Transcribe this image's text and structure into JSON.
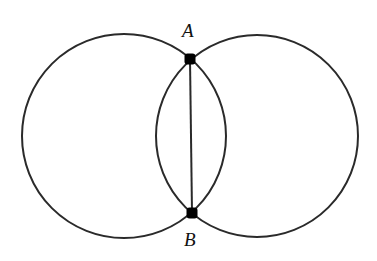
{
  "diagram": {
    "stroke_color": "#2a2a2a",
    "circles": [
      {
        "name": "left",
        "cx": 124,
        "cy": 136,
        "r": 102
      },
      {
        "name": "right",
        "cx": 257,
        "cy": 136,
        "r": 101
      }
    ],
    "points": [
      {
        "label": "A",
        "x": 190,
        "y": 59,
        "label_x": 182,
        "label_y": 21
      },
      {
        "label": "B",
        "x": 192,
        "y": 213,
        "label_x": 184,
        "label_y": 230
      }
    ],
    "segments": [
      {
        "from": "A",
        "to": "B"
      }
    ]
  }
}
